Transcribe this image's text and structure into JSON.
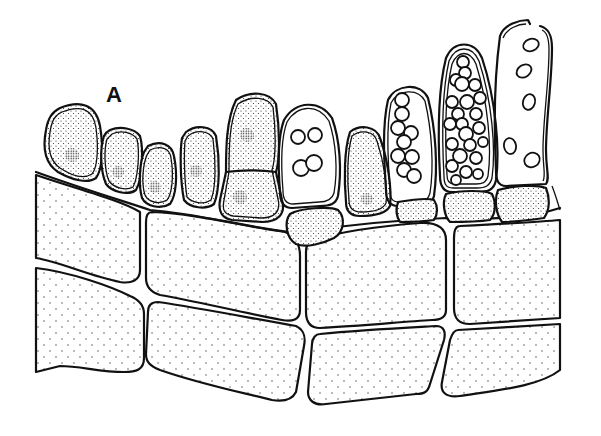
{
  "figure": {
    "panel_label": "A",
    "colors": {
      "ink": "#111111",
      "background": "#ffffff"
    },
    "elements": {
      "vegetative_cells_top_row": 5,
      "two_celled_cell": 1,
      "sporangia": [
        {
          "stage": "early",
          "spores": 4
        },
        {
          "stage": "mid",
          "spores": 12
        },
        {
          "stage": "mature",
          "spores": 24
        },
        {
          "stage": "empty/released",
          "spores": 6
        }
      ],
      "basal_large_cells_rows": 2
    }
  }
}
